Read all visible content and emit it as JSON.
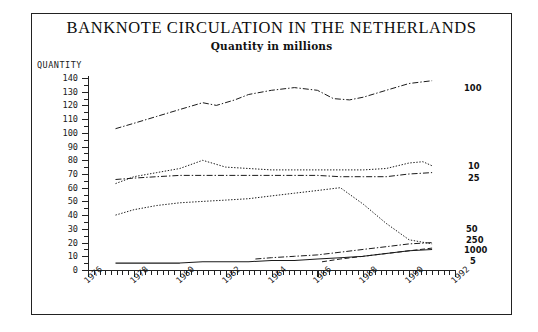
{
  "chart": {
    "title": "BANKNOTE CIRCULATION IN THE NETHERLANDS",
    "subtitle": "Quantity in millions",
    "y_axis_name": "QUANTITY"
  },
  "chart_data": {
    "type": "line",
    "title": "BANKNOTE CIRCULATION IN THE NETHERLANDS",
    "subtitle": "Quantity in millions",
    "xlabel": "",
    "ylabel": "QUANTITY",
    "xlim": [
      1976,
      1992
    ],
    "ylim": [
      0,
      140
    ],
    "yticks": [
      0,
      10,
      20,
      30,
      40,
      50,
      60,
      70,
      80,
      90,
      100,
      110,
      120,
      130,
      140
    ],
    "xticks": [
      1976,
      1978,
      1980,
      1982,
      1984,
      1986,
      1988,
      1990,
      1992
    ],
    "xtick_labels": [
      "1976",
      "1978",
      "1980",
      "1982",
      "1984",
      "1986",
      "1988",
      "1990",
      "1992"
    ],
    "grid": false,
    "legend": "right-inline-labels",
    "series": [
      {
        "name": "100",
        "label": "100",
        "style": "dash-dot",
        "x": [
          1977.2,
          1978,
          1979,
          1980,
          1981,
          1981.6,
          1982.4,
          1983,
          1984,
          1985,
          1986,
          1986.7,
          1987.4,
          1988,
          1989,
          1990,
          1991
        ],
        "values": [
          103,
          107,
          112,
          117,
          122,
          120,
          124,
          128,
          131,
          133,
          131,
          125,
          124,
          126,
          131,
          136,
          138
        ]
      },
      {
        "name": "10",
        "label": "10",
        "style": "dotted",
        "x": [
          1977.2,
          1978,
          1979,
          1980,
          1981,
          1982,
          1983,
          1984,
          1985,
          1986,
          1987,
          1988,
          1989,
          1990,
          1990.6,
          1991
        ],
        "values": [
          63,
          68,
          71,
          74,
          80,
          75,
          74,
          73,
          73,
          73,
          73,
          73,
          74,
          78,
          79,
          76
        ]
      },
      {
        "name": "25",
        "label": "25",
        "style": "dash-dot",
        "x": [
          1977.2,
          1978,
          1979,
          1980,
          1981,
          1982,
          1983,
          1984,
          1985,
          1986,
          1987,
          1988,
          1989,
          1990,
          1991
        ],
        "values": [
          66,
          67,
          68,
          69,
          69,
          69,
          69,
          69,
          69,
          69,
          68,
          68,
          68,
          70,
          71
        ]
      },
      {
        "name": "50",
        "label": "50",
        "style": "dotted",
        "x": [
          1977.2,
          1978,
          1979,
          1980,
          1981,
          1982,
          1983,
          1984,
          1985,
          1986,
          1987,
          1988,
          1989,
          1990,
          1991
        ],
        "values": [
          40,
          44,
          47,
          49,
          50,
          51,
          52,
          54,
          56,
          58,
          60,
          48,
          34,
          22,
          19
        ]
      },
      {
        "name": "250",
        "label": "250",
        "style": "dash-dot",
        "x": [
          1983.3,
          1984,
          1985,
          1986,
          1987,
          1988,
          1989,
          1990,
          1991
        ],
        "values": [
          8,
          9,
          10,
          11,
          13,
          15,
          17,
          19,
          20
        ]
      },
      {
        "name": "1000",
        "label": "1000",
        "style": "dashed",
        "x": [
          1986.2,
          1987,
          1988,
          1989,
          1990,
          1991
        ],
        "values": [
          6,
          8,
          10,
          12,
          14,
          16
        ]
      },
      {
        "name": "5",
        "label": "5",
        "style": "solid",
        "x": [
          1977.2,
          1978,
          1979,
          1980,
          1981,
          1982,
          1983,
          1984,
          1985,
          1986,
          1987,
          1988,
          1989,
          1990,
          1991
        ],
        "values": [
          5,
          5,
          5,
          5,
          6,
          6,
          6,
          7,
          7,
          8,
          9,
          10,
          12,
          14,
          15
        ]
      }
    ]
  }
}
